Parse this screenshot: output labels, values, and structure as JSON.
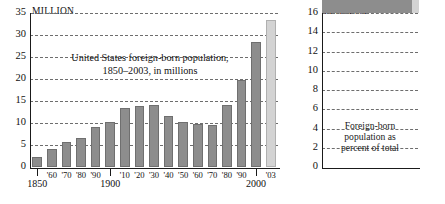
{
  "figure": {
    "background": "#ffffff",
    "bar_color": "#8d8d8d",
    "highlight_color": "#d3d3d3"
  },
  "left_panel": {
    "unit_label": "MILLION",
    "caption_line1": "United States foreign-born population,",
    "caption_line2": "1850–2003, in millions",
    "axis_major_labels": [
      "1850",
      "1900",
      "2000"
    ],
    "y_ticks": [
      "0",
      "5",
      "10",
      "15",
      "20",
      "25",
      "30",
      "35"
    ]
  },
  "right_panel": {
    "unit_label": "PERCENT",
    "caption_line1": "Foreign-born",
    "caption_line2": "population as",
    "caption_line3": "percent of total",
    "axis_major_labels": [
      "1850",
      "'70",
      "2003*"
    ],
    "y_ticks": [
      "0",
      "2",
      "4",
      "6",
      "8",
      "10",
      "12",
      "14",
      "16"
    ]
  },
  "chart_data": [
    {
      "id": "foreign-born-millions",
      "type": "bar",
      "title": "United States foreign-born population, 1850–2003, in millions",
      "xlabel": "",
      "ylabel": "MILLION",
      "ylim": [
        0,
        35
      ],
      "ytick_values": [
        0,
        5,
        10,
        15,
        20,
        25,
        30,
        35
      ],
      "grid": true,
      "legend": "none",
      "categories": [
        "1850",
        "'60",
        "'70",
        "'80",
        "'90",
        "1900",
        "'10",
        "'20",
        "'30",
        "'40",
        "'50",
        "'60",
        "'70",
        "'80",
        "'90",
        "2000",
        "'03"
      ],
      "values": [
        2.2,
        4.1,
        5.6,
        6.7,
        9.2,
        10.3,
        13.5,
        13.9,
        14.2,
        11.6,
        10.3,
        9.7,
        9.6,
        14.1,
        19.8,
        28.4,
        33.5
      ],
      "highlight_index": 16,
      "highlight_label": "'03"
    },
    {
      "id": "foreign-born-percent",
      "type": "area",
      "title": "Foreign-born population as percent of total",
      "xlabel": "",
      "ylabel": "PERCENT",
      "ylim": [
        0,
        16
      ],
      "ytick_values": [
        0,
        2,
        4,
        6,
        8,
        10,
        12,
        14,
        16
      ],
      "grid": true,
      "legend": "none",
      "categories": [
        "1850",
        "1860",
        "1870",
        "1880",
        "1890",
        "1900",
        "1910",
        "1920",
        "1930",
        "1940",
        "1950",
        "1960",
        "1970",
        "1980",
        "1990",
        "2000",
        "2003"
      ],
      "values": [
        9.7,
        13.2,
        14.4,
        13.3,
        14.8,
        13.6,
        14.7,
        13.2,
        11.6,
        8.8,
        6.9,
        5.4,
        4.7,
        6.2,
        7.9,
        10.4,
        11.7
      ],
      "highlight_index": 16,
      "highlight_label": "2003*"
    }
  ]
}
